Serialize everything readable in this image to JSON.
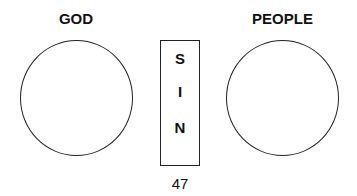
{
  "diagram": {
    "left": {
      "label": "GOD"
    },
    "right": {
      "label": "PEOPLE"
    },
    "separator": {
      "letters": [
        "S",
        "I",
        "N"
      ]
    },
    "page_number": "47"
  }
}
